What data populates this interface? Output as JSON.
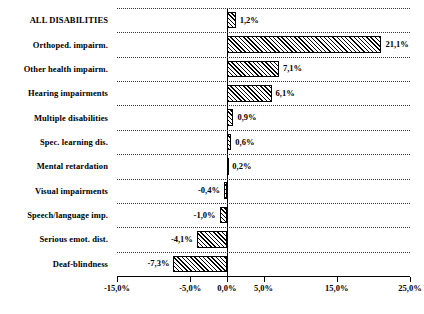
{
  "chart_data": {
    "type": "bar",
    "orientation": "horizontal",
    "title": "",
    "xlabel": "",
    "ylabel": "",
    "grid": true,
    "legend": false,
    "xlim": [
      -15.0,
      25.0
    ],
    "xticks": [
      -15.0,
      -5.0,
      0.0,
      5.0,
      15.0,
      25.0
    ],
    "xticklabels": [
      "-15,0%",
      "-5,0%",
      "0,0%",
      "5,0%",
      "15,0%",
      "25,0%"
    ],
    "categories": [
      "ALL DISABILITIES",
      "Orthoped. impairm.",
      "Other health impairm.",
      "Hearing impairments",
      "Multiple disabilities",
      "Spec. learning dis.",
      "Mental retardation",
      "Visual impairments",
      "Speech/language imp.",
      "Serious emot. dist.",
      "Deaf-blindness"
    ],
    "values": [
      1.2,
      21.1,
      7.1,
      6.1,
      0.9,
      0.6,
      0.2,
      -0.4,
      -1.0,
      -4.1,
      -7.3
    ],
    "datalabels": [
      "1,2%",
      "21,1%",
      "7,1%",
      "6,1%",
      "0,9%",
      "0,6%",
      "0,2%",
      "-0,4%",
      "-1,0%",
      "-4,1%",
      "-7,3%"
    ],
    "colors": {
      "bar_fill": "#ffffff",
      "bar_hatch": "#000000",
      "bar_edge": "#000000",
      "gridline": "#333333",
      "axis": "#000000",
      "text": "#000000"
    }
  }
}
